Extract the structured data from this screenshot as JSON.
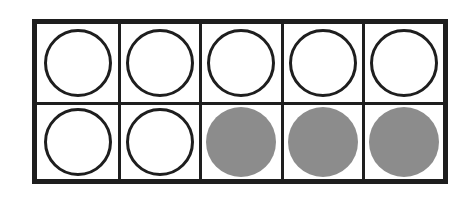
{
  "diagram": {
    "type": "ten-frame",
    "rows": 2,
    "columns": 5,
    "colors": {
      "border": "#1e1e1e",
      "empty_fill": "#ffffff",
      "filled_fill": "#8c8c8c"
    },
    "cells": [
      {
        "row": 0,
        "col": 0,
        "state": "empty"
      },
      {
        "row": 0,
        "col": 1,
        "state": "empty"
      },
      {
        "row": 0,
        "col": 2,
        "state": "empty"
      },
      {
        "row": 0,
        "col": 3,
        "state": "empty"
      },
      {
        "row": 0,
        "col": 4,
        "state": "empty"
      },
      {
        "row": 1,
        "col": 0,
        "state": "empty"
      },
      {
        "row": 1,
        "col": 1,
        "state": "empty"
      },
      {
        "row": 1,
        "col": 2,
        "state": "filled"
      },
      {
        "row": 1,
        "col": 3,
        "state": "filled"
      },
      {
        "row": 1,
        "col": 4,
        "state": "filled"
      }
    ],
    "counts": {
      "empty": 7,
      "filled": 3,
      "total": 10
    }
  }
}
